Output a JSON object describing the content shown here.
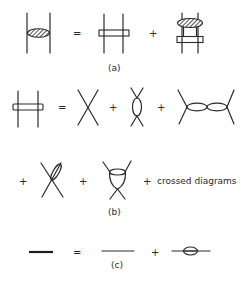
{
  "figure": {
    "panels": [
      {
        "id": "a",
        "caption": "(a)",
        "description": "Ladder equation: hatched blob between two lines equals rung plus blob-over-rung iteration"
      },
      {
        "id": "b",
        "caption": "(b)",
        "description": "Rung kernel expansion: four-point vertex, bubble, double bubble, crossed bubble, triangle loop, plus crossed diagrams"
      },
      {
        "id": "c",
        "caption": "(c)",
        "description": "Dressed propagator equals bare propagator plus self-energy insertion"
      }
    ],
    "operators": {
      "equals": "=",
      "plus": "+"
    },
    "crossed_text": "crossed diagrams",
    "colors": {
      "ink": "#2a2a2a",
      "background": "#ffffff"
    }
  }
}
